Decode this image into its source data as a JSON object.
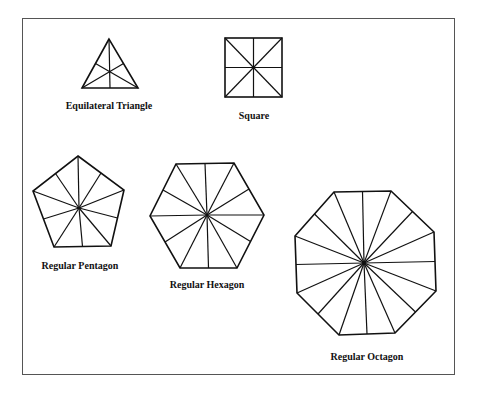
{
  "figure": {
    "background": "#ffffff",
    "line_color": "#111111",
    "frame_color": "#555555"
  },
  "shapes": [
    {
      "id": "triangle",
      "label": "Equilateral Triangle",
      "sides": 3,
      "divisions": "medians from each vertex to opposite side midpoint",
      "sub_triangles": 6
    },
    {
      "id": "square",
      "label": "Square",
      "sides": 4,
      "divisions": "two diagonals and two midlines",
      "sub_triangles": 8
    },
    {
      "id": "pentagon",
      "label": "Regular Pentagon",
      "sides": 5,
      "divisions": "center to each vertex and each edge midpoint",
      "sub_triangles": 10
    },
    {
      "id": "hexagon",
      "label": "Regular Hexagon",
      "sides": 6,
      "divisions": "center to each vertex and each edge midpoint",
      "sub_triangles": 12
    },
    {
      "id": "octagon",
      "label": "Regular Octagon",
      "sides": 8,
      "divisions": "center to each vertex and each edge midpoint",
      "sub_triangles": 16
    }
  ]
}
